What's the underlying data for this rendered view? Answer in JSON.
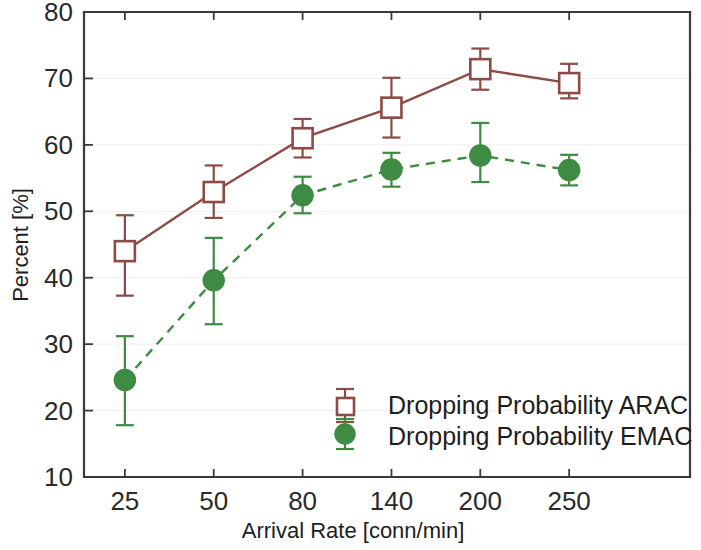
{
  "chart_data": {
    "type": "line",
    "title": "",
    "xlabel": "Arrival Rate [conn/min]",
    "ylabel": "Percent [%]",
    "categories": [
      "25",
      "50",
      "80",
      "140",
      "200",
      "250"
    ],
    "x_tick_labels": [
      "25",
      "50",
      "80",
      "140",
      "200",
      "250"
    ],
    "y_tick_labels": [
      "10",
      "20",
      "30",
      "40",
      "50",
      "60",
      "70",
      "80"
    ],
    "y_ticks": [
      10,
      20,
      30,
      40,
      50,
      60,
      70,
      80
    ],
    "ylim": [
      10,
      80
    ],
    "grid": true,
    "legend_position": "lower right inside",
    "series": [
      {
        "name": "Dropping Probability ARAC",
        "color": "#8C4B45",
        "marker": "open-square",
        "linestyle": "solid",
        "values": [
          44.0,
          52.9,
          61.0,
          65.6,
          71.4,
          69.3
        ],
        "err_low": [
          37.3,
          49.0,
          58.1,
          61.1,
          68.3,
          67.0
        ],
        "err_high": [
          49.4,
          56.9,
          63.9,
          70.1,
          74.5,
          72.2
        ]
      },
      {
        "name": "Dropping Probability EMAC",
        "color": "#3E8B43",
        "marker": "filled-circle",
        "linestyle": "dashed",
        "values": [
          24.6,
          39.6,
          52.4,
          56.3,
          58.4,
          56.2
        ],
        "err_low": [
          17.8,
          33.0,
          49.7,
          53.7,
          54.4,
          53.9
        ],
        "err_high": [
          31.2,
          46.0,
          55.2,
          58.8,
          63.3,
          58.5
        ]
      }
    ]
  },
  "legend": {
    "entries": [
      {
        "label": "Dropping Probability ARAC",
        "color": "#8C4B45",
        "marker": "open-square"
      },
      {
        "label": "Dropping Probability EMAC",
        "color": "#3E8B43",
        "marker": "filled-circle"
      }
    ]
  },
  "axes": {
    "x_title": "Arrival Rate [conn/min]",
    "y_title": "Percent [%]"
  }
}
